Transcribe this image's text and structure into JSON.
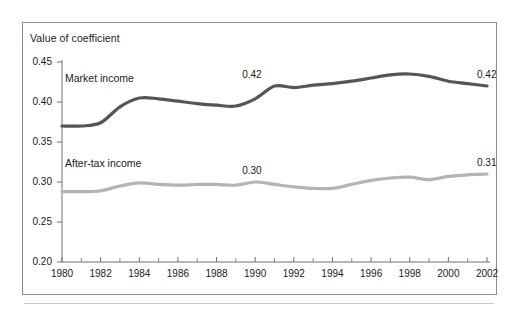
{
  "figure": {
    "background_color": "#ffffff",
    "frame_color": "#8d8d8d"
  },
  "chart_data": {
    "type": "line",
    "title": "",
    "subtitle": "",
    "ylabel": "Value of coefficient",
    "xlabel": "",
    "ylim": [
      0.2,
      0.45
    ],
    "xlim": [
      1980,
      2002
    ],
    "grid": false,
    "legend_position": "inline-series-labels",
    "ytick_labels": [
      "0.45",
      "0.40",
      "0.35",
      "0.30",
      "0.25",
      "0.20"
    ],
    "ytick_values": [
      0.45,
      0.4,
      0.35,
      0.3,
      0.25,
      0.2
    ],
    "xtick_labels": [
      "1980",
      "1982",
      "1984",
      "1986",
      "1988",
      "1990",
      "1992",
      "1994",
      "1996",
      "1998",
      "2000",
      "2002"
    ],
    "xtick_values": [
      1980,
      1982,
      1984,
      1986,
      1988,
      1990,
      1992,
      1994,
      1996,
      1998,
      2000,
      2002
    ],
    "minor_xticks": [
      1981,
      1983,
      1985,
      1987,
      1989,
      1991,
      1993,
      1995,
      1997,
      1999,
      2001
    ],
    "x": [
      1980,
      1981,
      1982,
      1983,
      1984,
      1985,
      1986,
      1987,
      1988,
      1989,
      1990,
      1991,
      1992,
      1993,
      1994,
      1995,
      1996,
      1997,
      1998,
      1999,
      2000,
      2001,
      2002
    ],
    "series": [
      {
        "name": "Market income",
        "color": "#555555",
        "line_width": 3.2,
        "values": [
          0.37,
          0.37,
          0.374,
          0.394,
          0.405,
          0.404,
          0.401,
          0.398,
          0.396,
          0.395,
          0.404,
          0.42,
          0.418,
          0.421,
          0.423,
          0.426,
          0.43,
          0.434,
          0.435,
          0.432,
          0.426,
          0.423,
          0.42
        ]
      },
      {
        "name": "After-tax income",
        "color": "#b4b4b4",
        "line_width": 3.2,
        "values": [
          0.288,
          0.288,
          0.289,
          0.295,
          0.299,
          0.297,
          0.296,
          0.297,
          0.297,
          0.296,
          0.3,
          0.297,
          0.294,
          0.292,
          0.292,
          0.297,
          0.302,
          0.305,
          0.306,
          0.303,
          0.307,
          0.309,
          0.31
        ]
      }
    ],
    "annotations": [
      {
        "text": "0.42",
        "series": "Market income",
        "x": 1990,
        "y": 0.42,
        "align": "above"
      },
      {
        "text": "0.42",
        "series": "Market income",
        "x": 2002,
        "y": 0.42,
        "align": "above"
      },
      {
        "text": "0.30",
        "series": "After-tax income",
        "x": 1990,
        "y": 0.3,
        "align": "above"
      },
      {
        "text": "0.31",
        "series": "After-tax income",
        "x": 2002,
        "y": 0.31,
        "align": "above"
      }
    ],
    "series_labels": [
      {
        "text": "Market income",
        "x_px": 65,
        "y_px": 72
      },
      {
        "text": "After-tax income",
        "x_px": 65,
        "y_px": 157
      }
    ]
  }
}
